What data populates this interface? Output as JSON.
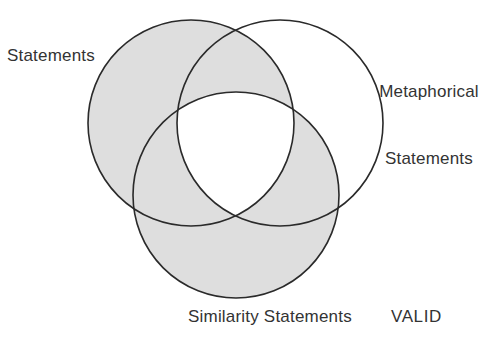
{
  "figure": {
    "type": "venn-diagram",
    "title": "",
    "background_color": "#ffffff",
    "shaded_fill_color": "#dedede",
    "unshaded_fill_color": "#ffffff",
    "stroke_color": "#2a2a2a",
    "text_color": "#333333",
    "stroke_width": 1.6
  },
  "labels": {
    "left": "Statements",
    "right_line1": "Metaphorical",
    "right_line2": "Statements",
    "bottom": "Similarity Statements",
    "corner": "VALID"
  },
  "chart_data": {
    "type": "venn",
    "title": "",
    "sets": [
      {
        "id": "left",
        "label": "Statements",
        "center_x": 191,
        "center_y": 123,
        "radius": 103,
        "label_position": "left"
      },
      {
        "id": "right",
        "label": "Metaphorical Statements",
        "center_x": 280,
        "center_y": 123,
        "radius": 103,
        "label_position": "right"
      },
      {
        "id": "bottom",
        "label": "Similarity Statements",
        "center_x": 236,
        "center_y": 195,
        "radius": 103,
        "label_position": "bottom"
      }
    ],
    "regions": [
      {
        "id": "left-only",
        "sets": [
          "left"
        ],
        "shaded": true
      },
      {
        "id": "right-only",
        "sets": [
          "right"
        ],
        "shaded": false
      },
      {
        "id": "bottom-only",
        "sets": [
          "bottom"
        ],
        "shaded": true
      },
      {
        "id": "left-right",
        "sets": [
          "left",
          "right"
        ],
        "shaded": true
      },
      {
        "id": "left-bottom",
        "sets": [
          "left",
          "bottom"
        ],
        "shaded": true
      },
      {
        "id": "right-bottom",
        "sets": [
          "right",
          "bottom"
        ],
        "shaded": true
      },
      {
        "id": "left-right-bottom",
        "sets": [
          "left",
          "right",
          "bottom"
        ],
        "shaded": false
      }
    ],
    "annotations": [
      {
        "text": "VALID",
        "x": 391,
        "y": 322
      }
    ],
    "legend": "none",
    "grid": false,
    "xlabel": "",
    "ylabel": ""
  }
}
